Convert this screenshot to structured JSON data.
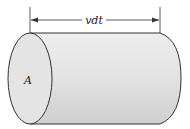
{
  "diagram": {
    "labels": {
      "length": "vdt",
      "area": "A"
    },
    "colors": {
      "body_fill": "#dcdcdc",
      "face_fill": "#e4e4e4",
      "stroke": "#333333"
    }
  }
}
